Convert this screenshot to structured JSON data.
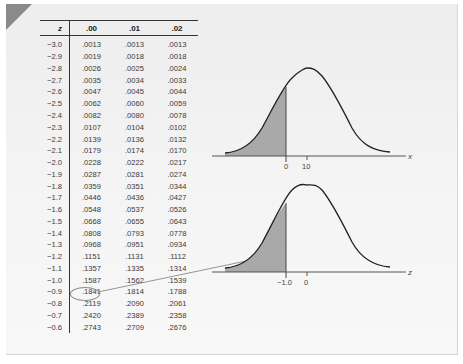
{
  "table": {
    "headers": [
      "z",
      ".00",
      ".01",
      ".02"
    ],
    "rows": [
      [
        "−3.0",
        ".0013",
        ".0013",
        ".0013"
      ],
      [
        "−2.9",
        ".0019",
        ".0018",
        ".0018"
      ],
      [
        "−2.8",
        ".0026",
        ".0025",
        ".0024"
      ],
      [
        "−2.7",
        ".0035",
        ".0034",
        ".0033"
      ],
      [
        "−2.6",
        ".0047",
        ".0045",
        ".0044"
      ],
      [
        "−2.5",
        ".0062",
        ".0060",
        ".0059"
      ],
      [
        "−2.4",
        ".0082",
        ".0080",
        ".0078"
      ],
      [
        "−2.3",
        ".0107",
        ".0104",
        ".0102"
      ],
      [
        "−2.2",
        ".0139",
        ".0136",
        ".0132"
      ],
      [
        "−2.1",
        ".0179",
        ".0174",
        ".0170"
      ],
      [
        "−2.0",
        ".0228",
        ".0222",
        ".0217"
      ],
      [
        "−1.9",
        ".0287",
        ".0281",
        ".0274"
      ],
      [
        "−1.8",
        ".0359",
        ".0351",
        ".0344"
      ],
      [
        "−1.7",
        ".0446",
        ".0436",
        ".0427"
      ],
      [
        "−1.6",
        ".0548",
        ".0537",
        ".0526"
      ],
      [
        "−1.5",
        ".0668",
        ".0655",
        ".0643"
      ],
      [
        "−1.4",
        ".0808",
        ".0793",
        ".0778"
      ],
      [
        "−1.3",
        ".0968",
        ".0951",
        ".0934"
      ],
      [
        "−1.2",
        ".1151",
        ".1131",
        ".1112"
      ],
      [
        "−1.1",
        ".1357",
        ".1335",
        ".1314"
      ],
      [
        "−1.0",
        ".1587",
        ".1562",
        ".1539"
      ],
      [
        "−0.9",
        ".1841",
        ".1814",
        ".1788"
      ],
      [
        "−0.8",
        ".2119",
        ".2090",
        ".2061"
      ],
      [
        "−0.7",
        ".2420",
        ".2389",
        ".2358"
      ],
      [
        "−0.6",
        ".2743",
        ".2709",
        ".2676"
      ]
    ],
    "highlighted_cell": {
      "z": "−1.0",
      "column": ".00",
      "value": ".1587"
    }
  },
  "top_curve": {
    "axis_label": "x",
    "ticks": [
      "0",
      "10"
    ],
    "shaded": "left tail below x = 0"
  },
  "bottom_curve": {
    "axis_label": "z",
    "ticks": [
      "−1.0",
      "0"
    ],
    "shaded": "left tail below z = −1.0"
  },
  "colors": {
    "background": "#f2f2f2",
    "shade": "#a9a9a9",
    "curve": "#222222",
    "corner": "#8a8a8a"
  },
  "chart_data": [
    {
      "type": "area",
      "title": "Normal curve of x",
      "xlabel": "x",
      "x_ticks": [
        "0",
        "10"
      ],
      "mean": 10,
      "shaded_region": {
        "from": "-inf",
        "to": 0
      },
      "grid": false
    },
    {
      "type": "area",
      "title": "Standard normal curve of z",
      "xlabel": "z",
      "x_ticks": [
        "-1.0",
        "0"
      ],
      "mean": 0,
      "shaded_region": {
        "from": "-inf",
        "to": -1.0
      },
      "shaded_area": 0.1587,
      "grid": false
    }
  ]
}
